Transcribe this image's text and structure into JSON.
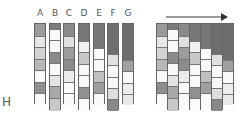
{
  "labels": [
    "A",
    "B",
    "C",
    "D",
    "E",
    "F",
    "G"
  ],
  "row_label": "H",
  "arrow": {
    "direction": "right"
  },
  "columns": [
    {
      "bottom": 104,
      "cells": [
        {
          "h": 12,
          "c": "#9a9a9a"
        },
        {
          "h": 11,
          "c": "#e8e8e8"
        },
        {
          "h": 12,
          "c": "#d4d4d4"
        },
        {
          "h": 11,
          "c": "#b8b8b8"
        },
        {
          "h": 12,
          "c": "#f8f8f8"
        },
        {
          "h": 11,
          "c": "#8e8e8e"
        },
        {
          "h": 12,
          "c": "#fafafa"
        }
      ]
    },
    {
      "bottom": 110,
      "cells": [
        {
          "h": 5,
          "c": "#7c7c7c"
        },
        {
          "h": 11,
          "c": "#fafafa"
        },
        {
          "h": 12,
          "c": "#f8f8f8"
        },
        {
          "h": 11,
          "c": "#8a8a8a"
        },
        {
          "h": 12,
          "c": "#f8f8f8"
        },
        {
          "h": 11,
          "c": "#e4e4e4"
        },
        {
          "h": 12,
          "c": "#a8a8a8"
        },
        {
          "h": 13,
          "c": "#c8c8c8"
        }
      ]
    },
    {
      "bottom": 104,
      "cells": [
        {
          "h": 12,
          "c": "#8a8a8a"
        },
        {
          "h": 11,
          "c": "#e0e0e0"
        },
        {
          "h": 12,
          "c": "#9c9c9c"
        },
        {
          "h": 11,
          "c": "#8c8c8c"
        },
        {
          "h": 12,
          "c": "#ebebeb"
        },
        {
          "h": 11,
          "c": "#fafafa"
        },
        {
          "h": 12,
          "c": "#fafafa"
        }
      ]
    },
    {
      "bottom": 110,
      "cells": [
        {
          "h": 17,
          "c": "#777777"
        },
        {
          "h": 11,
          "c": "#f0f0f0"
        },
        {
          "h": 12,
          "c": "#c8c8c8"
        },
        {
          "h": 11,
          "c": "#f8f8f8"
        },
        {
          "h": 12,
          "c": "#f8f8f8"
        },
        {
          "h": 11,
          "c": "#909090"
        },
        {
          "h": 13,
          "c": "#fafafa"
        }
      ]
    },
    {
      "bottom": 104,
      "cells": [
        {
          "h": 24,
          "c": "#777777"
        },
        {
          "h": 11,
          "c": "#fafafa"
        },
        {
          "h": 12,
          "c": "#f8f8f8"
        },
        {
          "h": 11,
          "c": "#c0c0c0"
        },
        {
          "h": 11,
          "c": "#9e9e9e"
        },
        {
          "h": 12,
          "c": "#fafafa"
        }
      ]
    },
    {
      "bottom": 110,
      "cells": [
        {
          "h": 30,
          "c": "#6e6e6e"
        },
        {
          "h": 11,
          "c": "#e0e0e0"
        },
        {
          "h": 12,
          "c": "#f8f8f8"
        },
        {
          "h": 11,
          "c": "#f8f8f8"
        },
        {
          "h": 11,
          "c": "#dedede"
        },
        {
          "h": 12,
          "c": "#888888"
        }
      ]
    },
    {
      "bottom": 104,
      "cells": [
        {
          "h": 36,
          "c": "#6e6e6e"
        },
        {
          "h": 11,
          "c": "#a0a0a0"
        },
        {
          "h": 12,
          "c": "#fafafa"
        },
        {
          "h": 11,
          "c": "#ededed"
        },
        {
          "h": 11,
          "c": "#e8e8e8"
        }
      ]
    }
  ],
  "layout": {
    "top": 23,
    "left_group_x": [
      34,
      49,
      63,
      78,
      93,
      107,
      122
    ],
    "left_col_w": 12,
    "right_group_x0": 156,
    "right_col_w": 11
  }
}
